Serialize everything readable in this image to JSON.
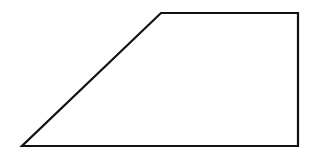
{
  "diagram": {
    "type": "trapezoid",
    "shape": "right-trapezoid",
    "background": "#ffffff",
    "stroke_color": "#111111",
    "stroke_width": 2.2,
    "fill": "none",
    "vertices": [
      {
        "name": "top-left",
        "x": 161,
        "y": 13
      },
      {
        "name": "top-right",
        "x": 298,
        "y": 13
      },
      {
        "name": "bottom-right",
        "x": 298,
        "y": 146
      },
      {
        "name": "bottom-left",
        "x": 22,
        "y": 146
      }
    ],
    "points": "161,13 298,13 298,146 22,146"
  }
}
